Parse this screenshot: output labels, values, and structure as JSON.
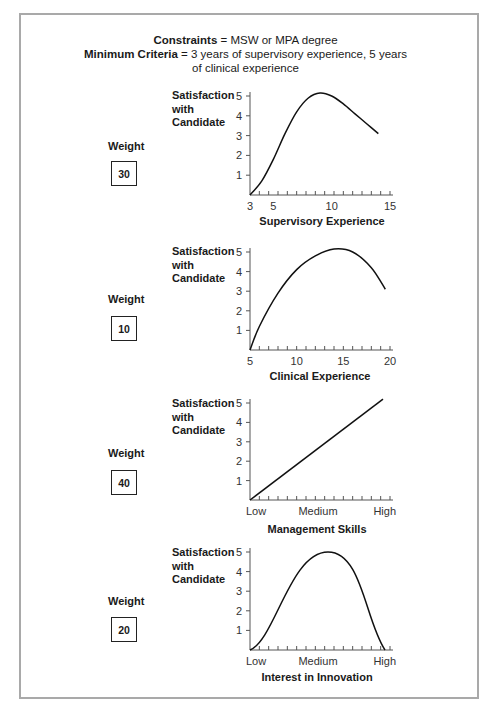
{
  "header": {
    "constraints_label": "Constraints",
    "constraints_value": " = MSW or MPA degree",
    "criteria_label": "Minimum Criteria",
    "criteria_value": " = 3 years of supervisory experience, 5 years of clinical experience"
  },
  "charts": [
    {
      "ylabel": [
        "Satisfaction",
        "with",
        "Candidate"
      ],
      "weight_label": "Weight",
      "weight": "30",
      "xlabel": "Supervisory Experience",
      "xticks": [
        "3",
        "5",
        "10",
        "15"
      ]
    },
    {
      "ylabel": [
        "Satisfaction",
        "with",
        "Candidate"
      ],
      "weight_label": "Weight",
      "weight": "10",
      "xlabel": "Clinical Experience",
      "xticks": [
        "5",
        "10",
        "15",
        "20"
      ]
    },
    {
      "ylabel": [
        "Satisfaction",
        "with",
        "Candidate"
      ],
      "weight_label": "Weight",
      "weight": "40",
      "xlabel": "Management Skills",
      "xticks": [
        "Low",
        "Medium",
        "High"
      ]
    },
    {
      "ylabel": [
        "Satisfaction",
        "with",
        "Candidate"
      ],
      "weight_label": "Weight",
      "weight": "20",
      "xlabel": "Interest in Innovation",
      "xticks": [
        "Low",
        "Medium",
        "High"
      ]
    }
  ],
  "chart_data": [
    {
      "type": "line",
      "title": "Supervisory Experience",
      "xlabel": "Supervisory Experience",
      "ylabel": "Satisfaction with Candidate",
      "weight": 30,
      "x": [
        3,
        4,
        5,
        6,
        7,
        8,
        9,
        10,
        11,
        12,
        13,
        14
      ],
      "values": [
        0,
        0.7,
        1.8,
        3.1,
        4.2,
        4.9,
        5.15,
        5.0,
        4.6,
        4.1,
        3.6,
        3.1
      ],
      "xticks": [
        3,
        5,
        10,
        15
      ],
      "yticks": [
        1,
        2,
        3,
        4,
        5
      ],
      "xlim": [
        3,
        15
      ],
      "ylim": [
        0,
        5
      ]
    },
    {
      "type": "line",
      "title": "Clinical Experience",
      "xlabel": "Clinical Experience",
      "ylabel": "Satisfaction with Candidate",
      "weight": 10,
      "x": [
        5,
        6,
        8,
        10,
        12,
        14,
        16,
        18,
        19.5
      ],
      "values": [
        0,
        1.2,
        2.9,
        4.1,
        4.8,
        5.15,
        5.0,
        4.2,
        3.1
      ],
      "xticks": [
        5,
        10,
        15,
        20
      ],
      "yticks": [
        1,
        2,
        3,
        4,
        5
      ],
      "xlim": [
        5,
        20
      ],
      "ylim": [
        0,
        5
      ]
    },
    {
      "type": "line",
      "title": "Management Skills",
      "xlabel": "Management Skills",
      "ylabel": "Satisfaction with Candidate",
      "weight": 40,
      "x": [
        "Low",
        "Medium",
        "High"
      ],
      "values": [
        0,
        2.6,
        5.2
      ],
      "yticks": [
        1,
        2,
        3,
        4,
        5
      ],
      "ylim": [
        0,
        5
      ]
    },
    {
      "type": "line",
      "title": "Interest in Innovation",
      "xlabel": "Interest in Innovation",
      "ylabel": "Satisfaction with Candidate",
      "weight": 20,
      "x": [
        "Low",
        "Medium",
        "High"
      ],
      "values": [
        0,
        5.0,
        0
      ],
      "yticks": [
        1,
        2,
        3,
        4,
        5
      ],
      "ylim": [
        0,
        5
      ]
    }
  ]
}
